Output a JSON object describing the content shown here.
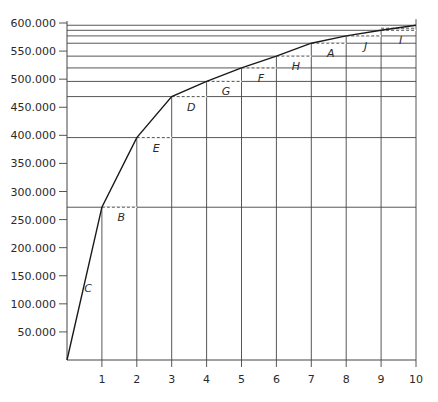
{
  "chart_data": {
    "type": "line",
    "title": "",
    "xlabel": "",
    "ylabel": "",
    "x": [
      0,
      1,
      2,
      3,
      4,
      5,
      6,
      7,
      8,
      9,
      10
    ],
    "series": [
      {
        "name": "cumulative curve",
        "values": [
          0,
          272000,
          396000,
          469000,
          496000,
          520000,
          541000,
          564000,
          577000,
          587000,
          596000
        ]
      }
    ],
    "xlim": [
      0,
      10
    ],
    "ylim": [
      0,
      600000
    ],
    "x_ticks": [
      "1",
      "2",
      "3",
      "4",
      "5",
      "6",
      "7",
      "8",
      "9",
      "10"
    ],
    "y_ticks": [
      "50.000",
      "100.000",
      "150.000",
      "200.000",
      "250.000",
      "300.000",
      "350.000",
      "400.000",
      "450.000",
      "500.000",
      "550.000",
      "600.000"
    ],
    "y_tick_values": [
      50000,
      100000,
      150000,
      200000,
      250000,
      300000,
      350000,
      400000,
      450000,
      500000,
      550000,
      600000
    ],
    "grid": "horizontal lines at each curve point extending to x=10; vertical lines at each integer x",
    "legend": "none",
    "annotations": [
      {
        "label": "C",
        "segment": "0-1"
      },
      {
        "label": "B",
        "segment": "1-2"
      },
      {
        "label": "E",
        "segment": "2-3"
      },
      {
        "label": "D",
        "segment": "3-4"
      },
      {
        "label": "G",
        "segment": "4-5"
      },
      {
        "label": "F",
        "segment": "5-6"
      },
      {
        "label": "H",
        "segment": "6-7"
      },
      {
        "label": "A",
        "segment": "7-8"
      },
      {
        "label": "J",
        "segment": "8-9"
      },
      {
        "label": "I",
        "segment": "9-10"
      }
    ]
  },
  "colors": {
    "line": "#1a1a1a",
    "grid": "#444444",
    "text": "#2a2a2a",
    "background": "#ffffff"
  }
}
